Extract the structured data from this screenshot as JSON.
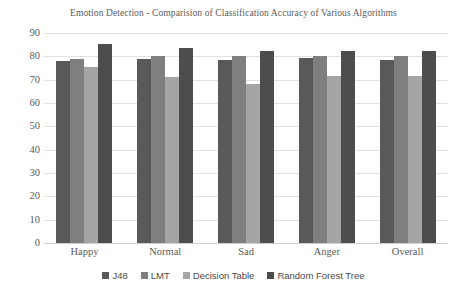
{
  "chart_data": {
    "type": "bar",
    "title": "Emotion Detection - Comparision of Classification Accuracy of Various Algorithms",
    "xlabel": "",
    "ylabel": "",
    "ylim": [
      0,
      90
    ],
    "ytick_step": 10,
    "yticks": [
      "90",
      "80",
      "70",
      "60",
      "50",
      "40",
      "30",
      "20",
      "10",
      "0"
    ],
    "grid": true,
    "legend_position": "bottom",
    "categories": [
      "Happy",
      "Normal",
      "Sad",
      "Anger",
      "Overall"
    ],
    "series": [
      {
        "name": "J48",
        "color": "#595959",
        "values": [
          78,
          79,
          78.5,
          79.5,
          78.5
        ]
      },
      {
        "name": "LMT",
        "color": "#7f7f7f",
        "values": [
          79,
          80,
          80,
          80,
          80
        ]
      },
      {
        "name": "Decision Table",
        "color": "#a5a5a5",
        "values": [
          75.5,
          71,
          68,
          71.5,
          71.5
        ]
      },
      {
        "name": "Random Forest Tree",
        "color": "#4d4d4d",
        "values": [
          85.5,
          83.5,
          82.5,
          82.5,
          82.5
        ]
      }
    ]
  },
  "colors": {
    "background": "#ffffff",
    "gridline": "#e2e2e2",
    "axis_text": "#595959",
    "title_text": "#5b5b5b",
    "legend_text": "#4a4a4a"
  }
}
